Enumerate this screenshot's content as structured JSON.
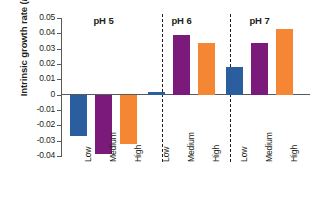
{
  "chart_data": {
    "type": "bar",
    "title": "",
    "xlabel": "",
    "ylabel": "Intrinsic growth rate (r)",
    "ylim": [
      -0.04,
      0.05
    ],
    "yticks": [
      0.05,
      0.04,
      0.03,
      0.02,
      0.01,
      0,
      -0.01,
      -0.02,
      -0.03,
      -0.04
    ],
    "ytick_labels": [
      "0.05",
      "0.04",
      "0.03",
      "0.02",
      "0.01",
      "0",
      "-0.01",
      "-0.02",
      "-0.03",
      "-0.04"
    ],
    "grid": false,
    "legend": "none",
    "panels": [
      {
        "title": "pH 5",
        "categories": [
          "Low",
          "Medium",
          "High"
        ],
        "values": [
          -0.027,
          -0.039,
          -0.032
        ]
      },
      {
        "title": "pH 6",
        "categories": [
          "Low",
          "Medium",
          "High"
        ],
        "values": [
          0.002,
          0.039,
          0.034
        ]
      },
      {
        "title": "pH 7",
        "categories": [
          "Low",
          "Medium",
          "High"
        ],
        "values": [
          0.018,
          0.034,
          0.043
        ]
      }
    ],
    "series_colors": {
      "Low": "#2b5e9e",
      "Medium": "#7b1a7b",
      "High": "#f58634"
    },
    "axis_color": "#58595b",
    "text_color": "#231f20",
    "background": "#ffffff"
  },
  "axis": {
    "ylabel_main": "Intrinsic growth rate (",
    "ylabel_italic": "r",
    "ylabel_close": ")"
  }
}
